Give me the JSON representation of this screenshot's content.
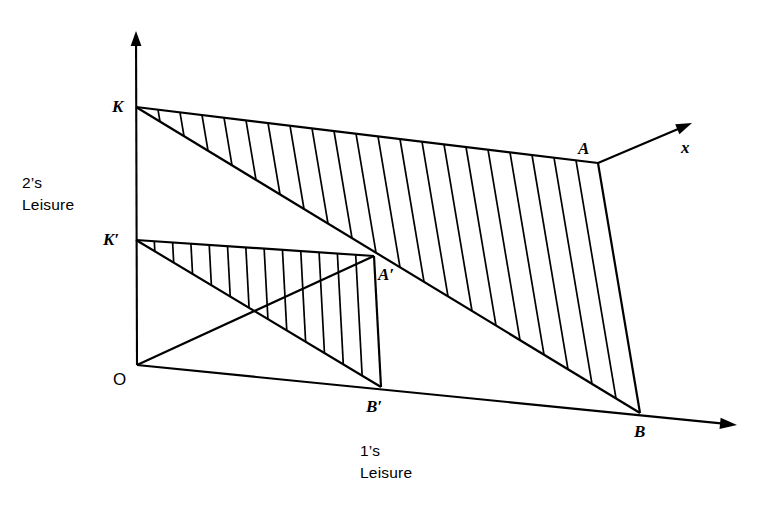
{
  "figure": {
    "caption_vertical": "2’s\nLeisure",
    "caption_horizontal": "1’s\nLeisure",
    "axis_label_x": "x",
    "stroke_color": "#000000",
    "background_color": "#ffffff"
  },
  "labels": {
    "origin": "O",
    "k_upper": "K",
    "k_lower": "K′",
    "a_upper": "A",
    "a_lower": "A′",
    "b_upper": "B",
    "b_lower": "B′"
  },
  "chart_data": {
    "type": "diagram",
    "title": "",
    "xlabel": "1’s Leisure",
    "ylabel": "2’s Leisure",
    "points": {
      "O": [
        137,
        365
      ],
      "K": [
        136,
        107
      ],
      "K_prime": [
        136,
        240
      ],
      "A": [
        598,
        163
      ],
      "A_prime": [
        374,
        256
      ],
      "B": [
        640,
        413
      ],
      "B_prime": [
        381,
        387
      ]
    },
    "axis_arrow_tips": {
      "vertical": [
        136,
        31
      ],
      "x_ray": [
        692,
        123
      ],
      "horizontal": [
        737,
        425
      ]
    },
    "hatch_counts": {
      "outer_region": 20,
      "inner_region": 12
    },
    "segments": [
      {
        "name": "vertical-axis",
        "from": "O",
        "to": "vertical-arrow"
      },
      {
        "name": "horizontal-axis",
        "from": "O",
        "to": "horizontal-arrow"
      },
      {
        "name": "x-ray",
        "from": "A",
        "to": "x-arrow"
      },
      {
        "name": "K-A-frontier",
        "from": "K",
        "to": "A"
      },
      {
        "name": "A-B-edge",
        "from": "A",
        "to": "B"
      },
      {
        "name": "K-B-diagonal",
        "from": "K",
        "to": "B"
      },
      {
        "name": "Kprime-Aprime-frontier",
        "from": "K_prime",
        "to": "A_prime"
      },
      {
        "name": "Aprime-Bprime-edge",
        "from": "A_prime",
        "to": "B_prime"
      },
      {
        "name": "Kprime-Bprime-diagonal",
        "from": "K_prime",
        "to": "B_prime"
      },
      {
        "name": "O-Aprime-ray",
        "from": "O",
        "to": "A_prime"
      }
    ]
  },
  "layout": {
    "label_positions": {
      "O": {
        "left": 113,
        "top": 371
      },
      "K": {
        "left": 112,
        "top": 98
      },
      "K_prime": {
        "left": 103,
        "top": 231
      },
      "A": {
        "left": 578,
        "top": 140
      },
      "A_prime": {
        "left": 378,
        "top": 266
      },
      "B": {
        "left": 634,
        "top": 423
      },
      "B_prime": {
        "left": 366,
        "top": 398
      },
      "x": {
        "left": 681,
        "top": 139
      },
      "caption_vertical": {
        "left": 22,
        "top": 172
      },
      "caption_horizontal": {
        "left": 360,
        "top": 440
      }
    }
  }
}
